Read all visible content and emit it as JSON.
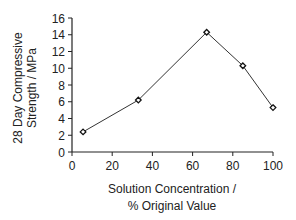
{
  "chart_data": {
    "type": "line",
    "title": "",
    "xlabel": "Solution Concentration / % Original Value",
    "xlabel_lines": [
      "Solution Concentration /",
      "% Original Value"
    ],
    "ylabel": "28 Day Compressive Strength / MPa",
    "ylabel_lines": [
      "28 Day Compressive",
      "Strength / MPa"
    ],
    "xlim": [
      0,
      100
    ],
    "ylim": [
      0,
      16
    ],
    "xticks": [
      0,
      20,
      40,
      60,
      80,
      100
    ],
    "yticks": [
      0,
      2,
      4,
      6,
      8,
      10,
      12,
      14,
      16
    ],
    "grid": false,
    "legend": null,
    "marker": "open-diamond",
    "series": [
      {
        "name": "28 Day Compressive Strength",
        "x": [
          5.5,
          33,
          67,
          85,
          100
        ],
        "y": [
          2.4,
          6.2,
          14.3,
          10.3,
          5.3
        ]
      }
    ],
    "colors": {
      "line": "#333333",
      "axis": "#222222",
      "text": "#222222"
    }
  }
}
